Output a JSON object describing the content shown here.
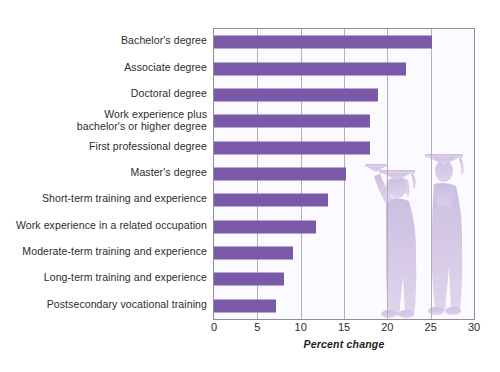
{
  "chart_data": {
    "type": "bar",
    "orientation": "horizontal",
    "title": "",
    "xlabel": "Percent change",
    "ylabel": "",
    "xlim": [
      0,
      30
    ],
    "xticks": [
      0,
      5,
      10,
      15,
      20,
      25,
      30
    ],
    "grid": true,
    "legend": false,
    "bar_color": "#7a5aa8",
    "plot_background": "#fbfaff",
    "categories": [
      "Bachelor's degree",
      "Associate degree",
      "Doctoral degree",
      "Work experience plus\nbachelor's or higher degree",
      "First professional degree",
      "Master's degree",
      "Short-term training and experience",
      "Work experience in a related occupation",
      "Moderate-term training and experience",
      "Long-term training and experience",
      "Postsecondary vocational training"
    ],
    "values": [
      25.1,
      22.1,
      18.9,
      18.0,
      18.0,
      15.2,
      13.1,
      11.8,
      9.1,
      8.1,
      7.1
    ]
  },
  "illustration": {
    "name": "two-graduates-in-cap-and-gown",
    "description": "Watermark illustration of two graduates wearing mortarboards and gowns"
  }
}
